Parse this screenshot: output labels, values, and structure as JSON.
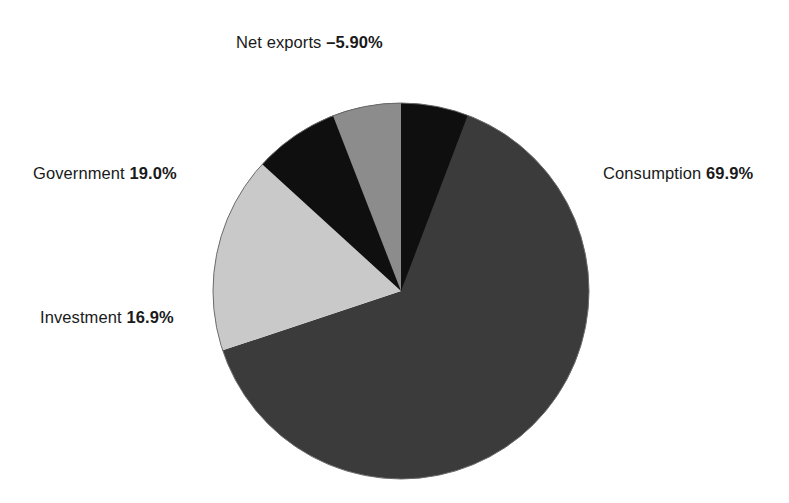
{
  "chart_data": {
    "type": "pie",
    "title": "",
    "subtitle": "",
    "xlabel": "",
    "ylabel": "",
    "legend_position": "callout-labels",
    "grid": false,
    "units": "percent of GDP",
    "start_angle_deg": 0,
    "direction": "clockwise",
    "categories": [
      "Consumption",
      "Investment",
      "Government",
      "Net exports"
    ],
    "values": [
      69.9,
      16.9,
      19.0,
      -5.9
    ],
    "colors": [
      "#3b3b3b",
      "#c9c9c9",
      "#0f0f0f",
      "#8c8c8c"
    ],
    "slices": [
      {
        "name": "Consumption",
        "value": 69.9,
        "value_text": "69.9%",
        "label_text": "Consumption",
        "color": "#3b3b3b",
        "start_deg": 0,
        "end_deg": 251.6
      },
      {
        "name": "Investment",
        "value": 16.9,
        "value_text": "16.9%",
        "label_text": "Investment",
        "color": "#c9c9c9",
        "start_deg": 251.6,
        "end_deg": 312.4
      },
      {
        "name": "Government",
        "value": 19.0,
        "value_text": "19.0%",
        "label_text": "Government",
        "color": "#0f0f0f",
        "start_deg": 312.4,
        "end_deg": 380.8
      },
      {
        "name": "Net exports",
        "value": -5.9,
        "value_text": "–5.90%",
        "label_text": "Net exports",
        "color": "#8c8c8c",
        "start_deg": 338.8,
        "end_deg": 360.0
      }
    ],
    "geometry": {
      "center_x": 401,
      "center_y": 291,
      "radius": 188
    }
  },
  "labels": {
    "consumption": {
      "name": "Consumption",
      "value": "69.9%"
    },
    "investment": {
      "name": "Investment",
      "value": "16.9%"
    },
    "government": {
      "name": "Government",
      "value": "19.0%"
    },
    "net_exports": {
      "name": "Net exports",
      "value": "–5.90%"
    }
  }
}
